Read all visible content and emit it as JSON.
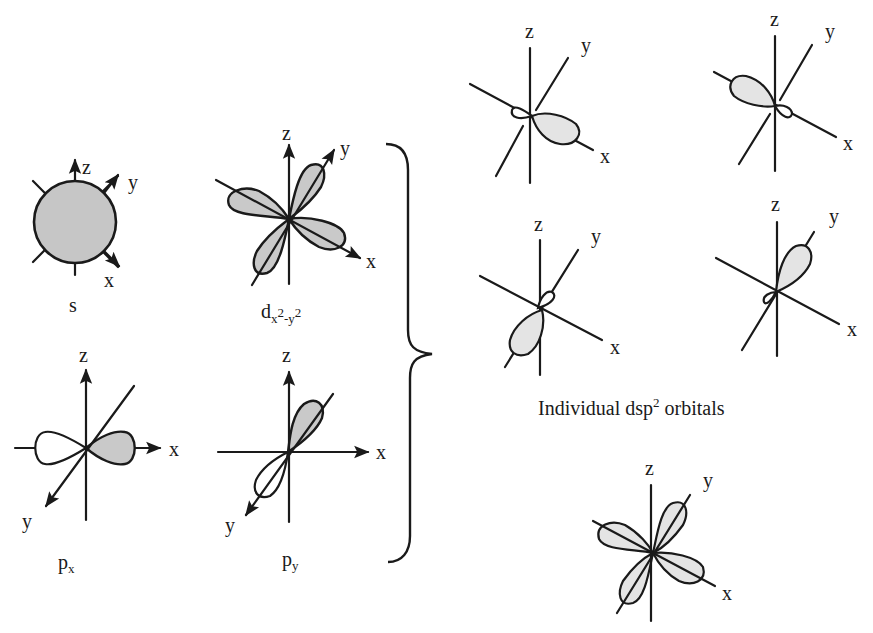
{
  "figure": {
    "atomic_orbitals": [
      {
        "id": "s",
        "label": "s",
        "sub": "",
        "axes": {
          "x": "x",
          "y": "y",
          "z": "z"
        }
      },
      {
        "id": "dx2y2",
        "label": "d",
        "sub_parts": [
          "x",
          "2",
          "-y",
          "2"
        ],
        "axes": {
          "x": "x",
          "y": "y",
          "z": "z"
        }
      },
      {
        "id": "px",
        "label": "p",
        "sub": "x",
        "axes": {
          "x": "x",
          "y": "y",
          "z": "z"
        }
      },
      {
        "id": "py",
        "label": "p",
        "sub": "y",
        "axes": {
          "x": "x",
          "y": "y",
          "z": "z"
        }
      }
    ],
    "hybrid_orbitals": [
      {
        "id": "hybrid-1",
        "direction": "+x",
        "axes": {
          "x": "x",
          "y": "y",
          "z": "z"
        }
      },
      {
        "id": "hybrid-2",
        "direction": "-x",
        "axes": {
          "x": "x",
          "y": "y",
          "z": "z"
        }
      },
      {
        "id": "hybrid-3",
        "direction": "-y",
        "axes": {
          "x": "x",
          "y": "y",
          "z": "z"
        }
      },
      {
        "id": "hybrid-4",
        "direction": "+y",
        "axes": {
          "x": "x",
          "y": "y",
          "z": "z"
        }
      }
    ],
    "hybrid_caption": {
      "main": "Individual dsp",
      "sup": "2",
      "tail": " orbitals"
    },
    "combined": {
      "id": "combined-dsp2",
      "axes": {
        "x": "x",
        "y": "y",
        "z": "z"
      }
    },
    "colors": {
      "ink": "#1a1a1a",
      "shade_dark": "#c6c6c6",
      "shade_light": "#e4e4e4",
      "background": "#ffffff"
    }
  }
}
